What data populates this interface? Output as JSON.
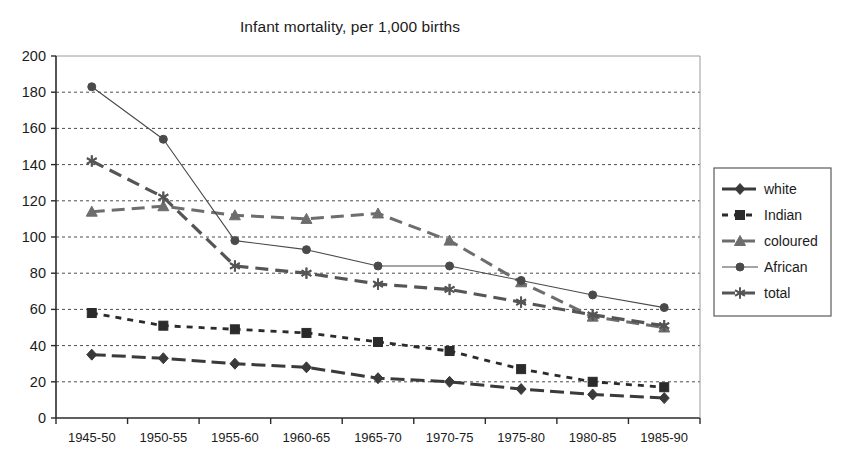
{
  "chart_data": {
    "type": "line",
    "title": "Infant mortality, per 1,000 births",
    "xlabel": "",
    "ylabel": "",
    "ylim": [
      0,
      200
    ],
    "ytick_step": 20,
    "grid": true,
    "legend_position": "right",
    "categories": [
      "1945-50",
      "1950-55",
      "1955-60",
      "1960-65",
      "1965-70",
      "1970-75",
      "1975-80",
      "1980-85",
      "1985-90"
    ],
    "yticks": [
      "0",
      "20",
      "40",
      "60",
      "80",
      "100",
      "120",
      "140",
      "160",
      "180",
      "200"
    ],
    "series": [
      {
        "name": "white",
        "marker": "diamond",
        "dash": "solid-thick",
        "color": "#3a3a3a",
        "values": [
          35,
          33,
          30,
          28,
          22,
          20,
          16,
          13,
          11
        ]
      },
      {
        "name": "Indian",
        "marker": "square",
        "dash": "dotted",
        "color": "#2b2b2b",
        "values": [
          58,
          51,
          49,
          47,
          42,
          37,
          27,
          20,
          17
        ]
      },
      {
        "name": "coloured",
        "marker": "triangle",
        "dash": "dashed",
        "color": "#6d6d6d",
        "values": [
          114,
          117,
          112,
          110,
          113,
          98,
          75,
          56,
          50
        ]
      },
      {
        "name": "African",
        "marker": "circle",
        "dash": "solid-thin",
        "color": "#4a4a4a",
        "values": [
          183,
          154,
          98,
          93,
          84,
          84,
          76,
          68,
          61
        ]
      },
      {
        "name": "total",
        "marker": "asterisk",
        "dash": "dashed-thick",
        "color": "#555555",
        "values": [
          142,
          122,
          84,
          80,
          74,
          71,
          64,
          57,
          51
        ]
      }
    ]
  },
  "legend": {
    "entries": [
      "white",
      "Indian",
      "coloured",
      "African",
      "total"
    ]
  }
}
